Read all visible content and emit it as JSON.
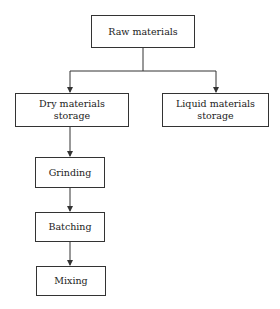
{
  "diagram": {
    "type": "flowchart",
    "nodes": [
      {
        "id": "raw",
        "label": "Raw materials"
      },
      {
        "id": "dry",
        "label": "Dry materials storage",
        "line1": "Dry materials",
        "line2": "storage"
      },
      {
        "id": "liquid",
        "label": "Liquid materials storage",
        "line1": "Liquid materials",
        "line2": "storage"
      },
      {
        "id": "grinding",
        "label": "Grinding"
      },
      {
        "id": "batching",
        "label": "Batching"
      },
      {
        "id": "mixing",
        "label": "Mixing"
      }
    ],
    "edges": [
      {
        "from": "raw",
        "to": "dry"
      },
      {
        "from": "raw",
        "to": "liquid"
      },
      {
        "from": "dry",
        "to": "grinding"
      },
      {
        "from": "grinding",
        "to": "batching"
      },
      {
        "from": "batching",
        "to": "mixing"
      }
    ],
    "colors": {
      "line": "#333333",
      "box_border": "#333333",
      "background": "#ffffff"
    }
  }
}
